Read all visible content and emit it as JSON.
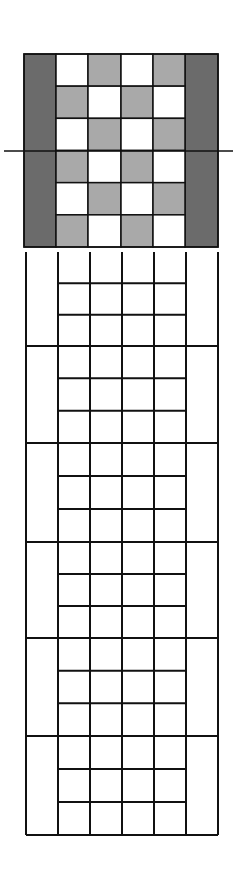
{
  "diagram": {
    "type": "weave-draft-grid",
    "colors": {
      "dark": "#6b6b6b",
      "light": "#a9a9a9",
      "white": "#ffffff",
      "line": "#111111"
    },
    "top_block": {
      "x": 24,
      "y": 54,
      "width": 194,
      "height": 193,
      "columns_x": [
        24,
        56,
        88,
        121,
        153,
        185,
        218
      ],
      "rows": 6,
      "border_columns": "dark",
      "inner_pattern": [
        [
          "white",
          "light",
          "white",
          "light"
        ],
        [
          "light",
          "white",
          "light",
          "white"
        ],
        [
          "white",
          "light",
          "white",
          "light"
        ],
        [
          "light",
          "white",
          "light",
          "white"
        ],
        [
          "white",
          "light",
          "white",
          "light"
        ],
        [
          "light",
          "white",
          "light",
          "white"
        ]
      ],
      "center_line": {
        "y": 151,
        "x1": 4,
        "x2": 233
      }
    },
    "bottom_grid": {
      "y_top": 252,
      "y_bottom": 835,
      "columns_x": [
        26,
        58,
        90,
        122,
        154,
        186,
        218
      ],
      "major_rows": 6,
      "minor_rows_per_major": 3,
      "major_lines_y": [
        346,
        443,
        542,
        638,
        736,
        835
      ]
    }
  }
}
